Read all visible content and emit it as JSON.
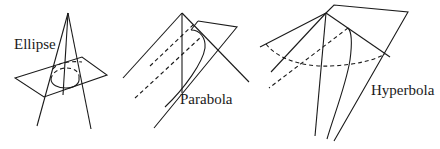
{
  "figure": {
    "panels": [
      {
        "id": "ellipse",
        "label": "Ellipse"
      },
      {
        "id": "parabola",
        "label": "Parabola"
      },
      {
        "id": "hyperbola",
        "label": "Hyperbola"
      }
    ],
    "colors": {
      "stroke": "#1a1a1a",
      "background": "#ffffff"
    }
  }
}
